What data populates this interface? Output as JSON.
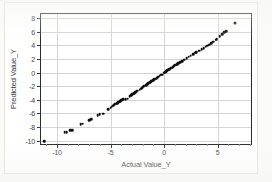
{
  "chart_data": {
    "type": "scatter",
    "title": "",
    "xlabel": "Actual Value_Y",
    "ylabel": "Predicted Value_Y",
    "xlim": [
      -11.5,
      8.3
    ],
    "ylim": [
      -10.8,
      8.6
    ],
    "xticks": [
      -10,
      -5,
      0,
      5
    ],
    "yticks": [
      -10,
      -8,
      -6,
      -4,
      -2,
      0,
      2,
      4,
      6,
      8
    ],
    "xtick_labels": [
      "-10",
      "-5",
      "0",
      "5"
    ],
    "ytick_labels": [
      "-10",
      "-8",
      "-6",
      "-4",
      "-2",
      "0",
      "2",
      "4",
      "6",
      "8"
    ],
    "grid": true,
    "grid_axis": "both",
    "legend": false,
    "marker": "filled-circle",
    "marker_color": "#0d0d0d",
    "series": [
      {
        "name": "Predicted vs Actual",
        "points": [
          [
            -11.2,
            -10.1
          ],
          [
            -9.3,
            -8.8
          ],
          [
            -9.1,
            -8.75
          ],
          [
            -8.8,
            -8.5
          ],
          [
            -8.6,
            -8.45
          ],
          [
            -7.8,
            -7.6
          ],
          [
            -7.6,
            -7.5
          ],
          [
            -7.0,
            -7.0
          ],
          [
            -6.8,
            -6.9
          ],
          [
            -6.2,
            -6.3
          ],
          [
            -6.0,
            -6.15
          ],
          [
            -5.7,
            -6.05
          ],
          [
            -5.2,
            -5.4
          ],
          [
            -5.0,
            -5.2
          ],
          [
            -4.9,
            -5.0
          ],
          [
            -4.8,
            -4.9
          ],
          [
            -4.7,
            -4.8
          ],
          [
            -4.6,
            -4.7
          ],
          [
            -4.5,
            -4.6
          ],
          [
            -4.4,
            -4.5
          ],
          [
            -4.3,
            -4.4
          ],
          [
            -4.2,
            -4.3
          ],
          [
            -4.1,
            -4.2
          ],
          [
            -4.0,
            -4.1
          ],
          [
            -3.9,
            -4.0
          ],
          [
            -3.8,
            -3.95
          ],
          [
            -3.6,
            -3.9
          ],
          [
            -3.4,
            -3.85
          ],
          [
            -3.2,
            -3.5
          ],
          [
            -3.1,
            -3.35
          ],
          [
            -3.0,
            -3.2
          ],
          [
            -2.9,
            -3.1
          ],
          [
            -2.8,
            -3.0
          ],
          [
            -2.7,
            -2.9
          ],
          [
            -2.6,
            -2.8
          ],
          [
            -2.5,
            -2.7
          ],
          [
            -2.3,
            -2.5
          ],
          [
            -2.2,
            -2.4
          ],
          [
            -2.1,
            -2.3
          ],
          [
            -2.0,
            -2.15
          ],
          [
            -1.9,
            -2.05
          ],
          [
            -1.8,
            -1.95
          ],
          [
            -1.7,
            -1.85
          ],
          [
            -1.6,
            -1.75
          ],
          [
            -1.5,
            -1.6
          ],
          [
            -1.4,
            -1.5
          ],
          [
            -1.3,
            -1.4
          ],
          [
            -1.2,
            -1.3
          ],
          [
            -1.1,
            -1.2
          ],
          [
            -1.0,
            -1.1
          ],
          [
            -0.9,
            -1.0
          ],
          [
            -0.8,
            -0.9
          ],
          [
            -0.7,
            -0.8
          ],
          [
            -0.6,
            -0.7
          ],
          [
            -0.5,
            -0.6
          ],
          [
            -0.4,
            -0.45
          ],
          [
            -0.3,
            -0.35
          ],
          [
            -0.15,
            -0.3
          ],
          [
            0.0,
            -0.05
          ],
          [
            0.1,
            0.05
          ],
          [
            0.2,
            0.2
          ],
          [
            0.3,
            0.3
          ],
          [
            0.4,
            0.4
          ],
          [
            0.5,
            0.5
          ],
          [
            0.6,
            0.6
          ],
          [
            0.7,
            0.7
          ],
          [
            0.8,
            0.8
          ],
          [
            0.9,
            0.95
          ],
          [
            1.0,
            1.05
          ],
          [
            1.1,
            1.15
          ],
          [
            1.2,
            1.25
          ],
          [
            1.3,
            1.35
          ],
          [
            1.5,
            1.5
          ],
          [
            1.7,
            1.7
          ],
          [
            1.9,
            1.9
          ],
          [
            2.1,
            2.1
          ],
          [
            2.3,
            2.3
          ],
          [
            2.5,
            2.45
          ],
          [
            2.7,
            2.7
          ],
          [
            2.9,
            2.9
          ],
          [
            3.0,
            3.0
          ],
          [
            3.3,
            3.2
          ],
          [
            3.5,
            3.4
          ],
          [
            3.7,
            3.6
          ],
          [
            3.9,
            3.8
          ],
          [
            4.0,
            3.95
          ],
          [
            4.2,
            4.1
          ],
          [
            4.4,
            4.3
          ],
          [
            4.6,
            4.55
          ],
          [
            4.8,
            4.8
          ],
          [
            4.9,
            4.9
          ],
          [
            5.2,
            5.3
          ],
          [
            5.4,
            5.6
          ],
          [
            5.6,
            5.9
          ],
          [
            5.8,
            6.1
          ],
          [
            6.6,
            7.3
          ]
        ]
      }
    ],
    "annotations": [
      {
        "name": "outlier-point",
        "x": 6.6,
        "y": 7.3,
        "note": "isolated point separated from main trend in upper right"
      }
    ]
  }
}
